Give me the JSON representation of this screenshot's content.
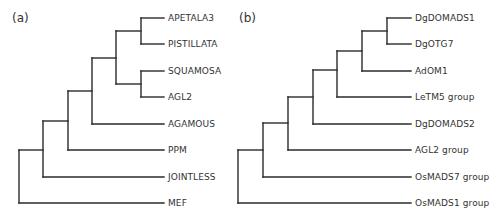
{
  "panels": [
    {
      "label": "(a)",
      "leaves": [
        "APETALA3",
        "PISTILLATA",
        "SQUAMOSA",
        "AGL2",
        "AGAMOUS",
        "PPM",
        "JOINTLESS",
        "MEF"
      ],
      "tree": "((((((APETALA3,PISTILLATA),(SQUAMOSA,AGL2)),AGAMOUS),PPM),JOINTLESS),MEF)"
    },
    {
      "label": "(b)",
      "leaves": [
        "DgDOMADS1",
        "DgOTG7",
        "AdOM1",
        "LeTM5 group",
        "DgDOMADS2",
        "AGL2 group",
        "OsMADS7 group",
        "OsMADS1 group"
      ],
      "tree": "(((((((DgDOMADS1,DgOTG7),AdOM1),LeTM5 group),DgDOMADS2),AGL2 group),OsMADS7 group),OsMADS1 group)"
    }
  ],
  "colors": {
    "line": "#2a2a2a",
    "text": "#333333"
  }
}
